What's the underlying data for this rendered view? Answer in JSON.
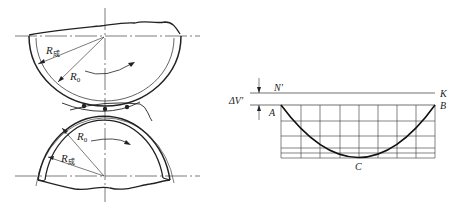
{
  "figure": {
    "roll_diagram": {
      "upper_roll": {
        "outer_radius_label": "R",
        "outer_radius_subscript": "成",
        "inner_radius_label": "R",
        "inner_radius_subscript": "0",
        "rotation": "clockwise"
      },
      "lower_roll": {
        "inner_radius_label": "R",
        "inner_radius_subscript": "0",
        "outer_radius_label": "R",
        "outer_radius_subscript": "成",
        "rotation": "clockwise"
      },
      "contact_points": 3
    },
    "deviation_diagram": {
      "labels": {
        "delta": "ΔV′",
        "n_prime": "N′",
        "k": "K",
        "a": "A",
        "b": "B",
        "c": "C"
      },
      "grid": {
        "columns": 8,
        "rows": 5
      },
      "curve": "parabola"
    }
  }
}
